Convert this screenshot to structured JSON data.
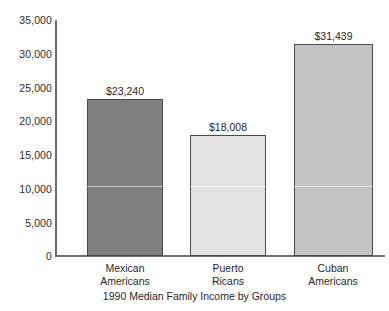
{
  "chart_data": {
    "type": "bar",
    "title": "",
    "caption": "1990 Median Family Income by Groups",
    "xlabel": "",
    "ylabel": "",
    "categories": [
      "Mexican Americans",
      "Puerto Ricans",
      "Cuban Americans"
    ],
    "category_lines": [
      [
        "Mexican",
        "Americans"
      ],
      [
        "Puerto",
        "Ricans"
      ],
      [
        "Cuban",
        "Americans"
      ]
    ],
    "values": [
      23240,
      18008,
      31439
    ],
    "value_labels": [
      "$23,240",
      "$18,008",
      "$31,439"
    ],
    "bar_colors": [
      "#808080",
      "#e3e3e3",
      "#c4c4c4"
    ],
    "bar_border_color": "#4a4a4a",
    "ylim": [
      0,
      35000
    ],
    "ytick_values": [
      35000,
      30000,
      25000,
      20000,
      15000,
      10000,
      5000,
      0
    ],
    "ytick_labels": [
      "35,000",
      "30,000",
      "25,000",
      "20,000",
      "15,000",
      "10,000",
      "5,000",
      "0"
    ],
    "grid": false,
    "legend": "none",
    "axis_color": "#6e6e6e"
  }
}
